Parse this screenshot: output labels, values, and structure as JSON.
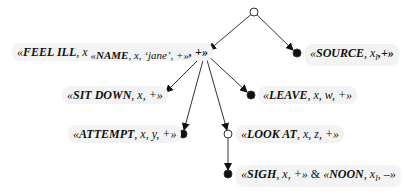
{
  "diagram": {
    "type": "tree",
    "nodes": [
      {
        "id": "root",
        "kind": "open"
      },
      {
        "id": "feel_ill",
        "kind": "open",
        "label_prefix": "«",
        "name": "FEEL ILL",
        "args": ", x",
        "nested": "«NAME, x, ‘jane’, +»",
        "tail": ", +»"
      },
      {
        "id": "source",
        "kind": "filled",
        "name": "SOURCE",
        "args": ", x",
        "sub": "l",
        "tail": ",+»"
      },
      {
        "id": "sit_down",
        "kind": "filled",
        "name": "SIT DOWN",
        "tail": ", x, +»"
      },
      {
        "id": "leave",
        "kind": "filled",
        "name": "LEAVE",
        "tail": ", x, w, +»"
      },
      {
        "id": "attempt",
        "kind": "filled",
        "name": "ATTEMPT",
        "tail": ", x, y, +»"
      },
      {
        "id": "look_at",
        "kind": "open",
        "name": "LOOK AT",
        "tail": ", x, z, +»"
      },
      {
        "id": "sigh",
        "kind": "filled",
        "name": "SIGH",
        "tail": ", x, +»",
        "conj": " & ",
        "name2": "NOON",
        "args2": ", x",
        "sub2": "l",
        "tail2": ", –»"
      }
    ],
    "edges": [
      [
        "root",
        "feel_ill"
      ],
      [
        "root",
        "source"
      ],
      [
        "feel_ill",
        "sit_down"
      ],
      [
        "feel_ill",
        "leave"
      ],
      [
        "feel_ill",
        "attempt"
      ],
      [
        "feel_ill",
        "look_at"
      ],
      [
        "look_at",
        "sigh"
      ]
    ]
  },
  "labels": {
    "open_q": "«",
    "feel_name": "FEEL ILL",
    "feel_x": ", x",
    "feel_nested_name": "NAME",
    "feel_nested_rest": ", x, ‘jane’, +»",
    "feel_tail": ", +»",
    "source_name": "SOURCE",
    "source_x": ", x",
    "source_sub": "l",
    "source_tail": ",+»",
    "sit_name": "SIT DOWN",
    "sit_tail": ", x, +»",
    "leave_name": "LEAVE",
    "leave_tail": ", x, w, +»",
    "attempt_name": "ATTEMPT",
    "attempt_tail": ", x, y, +»",
    "look_name": "LOOK AT",
    "look_tail": ", x, z, +»",
    "sigh_name": "SIGH",
    "sigh_tail": ", x, +»",
    "conj": " & ",
    "noon_name": "NOON",
    "noon_x": ", x",
    "noon_sub": "l",
    "noon_tail": ", –»"
  }
}
